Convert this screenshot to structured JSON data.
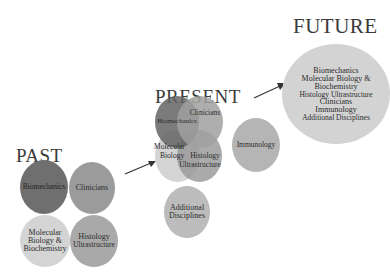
{
  "headings": {
    "past": "PAST",
    "present": "PRESENT",
    "future": "FUTURE"
  },
  "past": {
    "biomechanics": "Biomechanics",
    "clinicians": "Clinicians",
    "molecular": [
      "Molecular",
      "Biology &",
      "Biochemistry"
    ],
    "histology": [
      "Histology",
      "Ultrastructure"
    ]
  },
  "present": {
    "biomechanics": "Biomechanics",
    "clinicians": "Clinicians",
    "molecular": [
      "Molecular",
      "Biology"
    ],
    "histology": [
      "Histology",
      "Ultrastructure"
    ],
    "immunology": "Immunology",
    "additional": [
      "Additional",
      "Disciplines"
    ]
  },
  "future": {
    "items": [
      "Biomechanics",
      "Molecular Biology &",
      "Biochemistry",
      "Histology Ultrastructure",
      "Clinicians",
      "Immunology",
      "Additional Disciplines"
    ]
  },
  "colors": {
    "biomechanics": "#6e6e6e",
    "clinicians": "#9a9a9a",
    "molecular": "#cfcfcf",
    "histology": "#a8a8a8",
    "immunology": "#b4b4b4",
    "additional": "#bdbdbd",
    "future": "#d2d2d2"
  }
}
